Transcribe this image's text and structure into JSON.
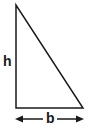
{
  "diagram": {
    "type": "right-triangle",
    "labels": {
      "height": "h",
      "base": "b"
    },
    "colors": {
      "stroke": "#1a1a1a",
      "background": "#ffffff"
    }
  }
}
